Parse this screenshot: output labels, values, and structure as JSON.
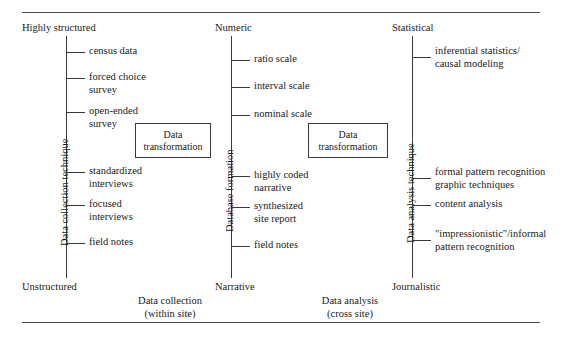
{
  "figure": {
    "type": "diagram"
  },
  "rules": {
    "top": "horizontal-rule-top",
    "bottom": "horizontal-rule-bottom"
  },
  "columns": [
    {
      "id": "data-collection",
      "axis_title": "Data collection technique",
      "top_pole": "Highly structured",
      "bottom_pole": "Unstructured",
      "items": [
        {
          "label": "census data"
        },
        {
          "label": "forced choice\nsurvey"
        },
        {
          "label": "open-ended\nsurvey"
        },
        {
          "label": "standardized\ninterviews"
        },
        {
          "label": "focused\ninterviews"
        },
        {
          "label": "field notes"
        }
      ]
    },
    {
      "id": "database-formation",
      "axis_title": "Database formation",
      "top_pole": "Numeric",
      "bottom_pole": "Narrative",
      "items": [
        {
          "label": "ratio scale"
        },
        {
          "label": "interval scale"
        },
        {
          "label": "nominal scale"
        },
        {
          "label": "highly coded\nnarrative"
        },
        {
          "label": "synthesized\nsite report"
        },
        {
          "label": "field notes"
        }
      ]
    },
    {
      "id": "data-analysis",
      "axis_title": "Data analysis technique",
      "top_pole": "Statistical",
      "bottom_pole": "Journalistic",
      "items": [
        {
          "label": "inferential statistics/\ncausal modeling"
        },
        {
          "label": "formal pattern recognition\ngraphic techniques"
        },
        {
          "label": "content analysis"
        },
        {
          "label": "\"impressionistic\"/informal\npattern recognition"
        }
      ]
    }
  ],
  "transformation_boxes": [
    {
      "id": "box-left",
      "label": "Data\ntransformation"
    },
    {
      "id": "box-right",
      "label": "Data\ntransformation"
    }
  ],
  "captions": [
    {
      "id": "caption-collection",
      "label": "Data collection\n(within site)"
    },
    {
      "id": "caption-analysis",
      "label": "Data analysis\n(cross site)"
    }
  ],
  "colors": {
    "ink": "#1a1a1a",
    "line": "#3a3a3a",
    "rule": "#4a4a4a",
    "background": "#ffffff"
  }
}
